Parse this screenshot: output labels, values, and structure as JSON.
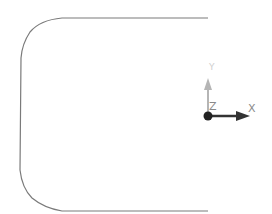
{
  "canvas": {
    "background": "#ffffff"
  },
  "sketch": {
    "profile_color": "#7a7a7a",
    "description": "open rounded profile"
  },
  "axes": {
    "x_label": "X",
    "y_label": "Y",
    "z_label": "Z",
    "x_color": "#333333",
    "y_color": "#b5b5b5",
    "origin_color": "#222222"
  }
}
